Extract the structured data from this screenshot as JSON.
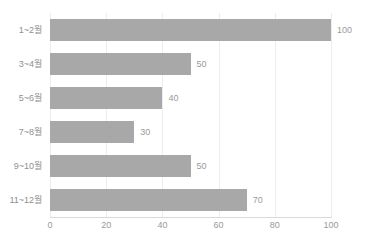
{
  "chart_data": {
    "type": "bar",
    "orientation": "horizontal",
    "title": "",
    "xlabel": "",
    "ylabel": "",
    "categories": [
      "1~2월",
      "3~4월",
      "5~6월",
      "7~8월",
      "9~10월",
      "11~12월"
    ],
    "values": [
      100,
      50,
      40,
      30,
      50,
      70
    ],
    "value_labels": [
      "100",
      "50",
      "40",
      "30",
      "50",
      "70"
    ],
    "xlim": [
      0,
      100
    ],
    "xticks": [
      0,
      20,
      40,
      60,
      80,
      100
    ],
    "xtick_labels": [
      "0",
      "20",
      "40",
      "60",
      "80",
      "100"
    ],
    "grid": "vertical",
    "legend": "none",
    "bar_color": "#a8a8a8",
    "gridline_color": "#ededed",
    "axis_color": "#d9d9d9",
    "label_color": "#9a9a9a"
  }
}
